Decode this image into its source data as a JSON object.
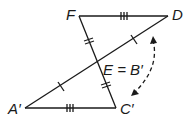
{
  "diagram": {
    "type": "geometry-congruent-triangles",
    "points": {
      "F": {
        "label": "F",
        "x": 79,
        "y": 16
      },
      "D": {
        "label": "D",
        "x": 168,
        "y": 16
      },
      "E": {
        "label": "E = B′",
        "x": 97,
        "y": 63
      },
      "A": {
        "label": "A′",
        "x": 25,
        "y": 108
      },
      "C": {
        "label": "C′",
        "x": 116,
        "y": 108
      }
    },
    "segments": [
      {
        "from": "F",
        "to": "D",
        "ticks": 3
      },
      {
        "from": "A",
        "to": "C",
        "ticks": 3
      },
      {
        "from": "F",
        "to": "E",
        "ticks": 2
      },
      {
        "from": "E",
        "to": "C",
        "ticks": 2
      },
      {
        "from": "D",
        "to": "E",
        "ticks": 1
      },
      {
        "from": "E",
        "to": "A",
        "ticks": 1
      }
    ],
    "rotation_arrow": {
      "style": "dashed",
      "direction": "double-headed",
      "meaning": "rotation about E"
    },
    "stroke_color": "#1a1a1a"
  }
}
